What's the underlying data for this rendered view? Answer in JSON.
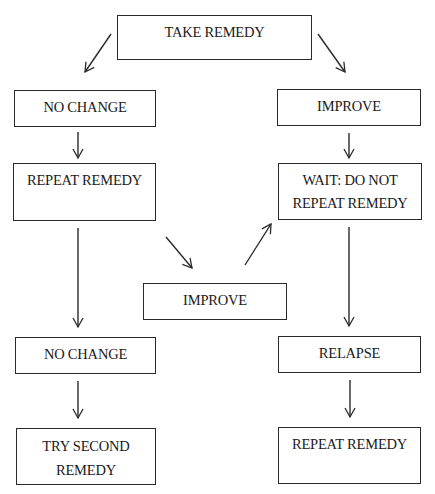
{
  "diagram": {
    "nodes": {
      "take_remedy": {
        "lines": [
          "TAKE REMEDY"
        ]
      },
      "no_change_1": {
        "lines": [
          "NO CHANGE"
        ]
      },
      "repeat_remedy_1": {
        "lines": [
          "REPEAT REMEDY"
        ]
      },
      "improve_1": {
        "lines": [
          "IMPROVE"
        ]
      },
      "wait": {
        "lines": [
          "WAIT: DO NOT",
          "REPEAT REMEDY"
        ]
      },
      "improve_2": {
        "lines": [
          "IMPROVE"
        ]
      },
      "no_change_2": {
        "lines": [
          "NO CHANGE"
        ]
      },
      "try_second": {
        "lines": [
          "TRY SECOND",
          "REMEDY"
        ]
      },
      "relapse": {
        "lines": [
          "RELAPSE"
        ]
      },
      "repeat_remedy_2": {
        "lines": [
          "REPEAT REMEDY"
        ]
      }
    },
    "edges": [
      [
        "take_remedy",
        "no_change_1"
      ],
      [
        "take_remedy",
        "improve_1"
      ],
      [
        "no_change_1",
        "repeat_remedy_1"
      ],
      [
        "improve_1",
        "wait"
      ],
      [
        "repeat_remedy_1",
        "improve_2"
      ],
      [
        "improve_2",
        "wait"
      ],
      [
        "repeat_remedy_1",
        "no_change_2"
      ],
      [
        "wait",
        "relapse"
      ],
      [
        "no_change_2",
        "try_second"
      ],
      [
        "relapse",
        "repeat_remedy_2"
      ]
    ]
  }
}
